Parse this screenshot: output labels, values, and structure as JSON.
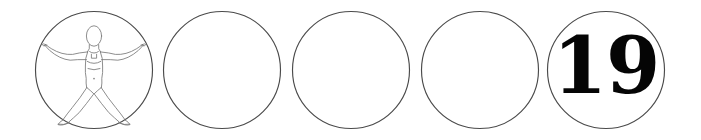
{
  "canvas": {
    "width": 701,
    "height": 140,
    "background_color": "#ffffff"
  },
  "style": {
    "ring_stroke_color": "#4a4a4a",
    "figure_stroke_color": "#787878",
    "numeral_color": "#050505"
  },
  "badges": [
    {
      "index": 1,
      "name": "vitruvian-figure-badge",
      "content_type": "figure",
      "label": "",
      "center_x": 94,
      "center_y": 70,
      "radius": 59
    },
    {
      "index": 2,
      "name": "empty-badge-2",
      "content_type": "empty",
      "label": "",
      "center_x": 222,
      "center_y": 70,
      "radius": 59
    },
    {
      "index": 3,
      "name": "empty-badge-3",
      "content_type": "empty",
      "label": "",
      "center_x": 351,
      "center_y": 70,
      "radius": 59
    },
    {
      "index": 4,
      "name": "empty-badge-4",
      "content_type": "empty",
      "label": "",
      "center_x": 480,
      "center_y": 70,
      "radius": 59
    },
    {
      "index": 5,
      "name": "number-badge",
      "content_type": "number",
      "label": "19",
      "center_x": 606,
      "center_y": 70,
      "radius": 59
    }
  ]
}
